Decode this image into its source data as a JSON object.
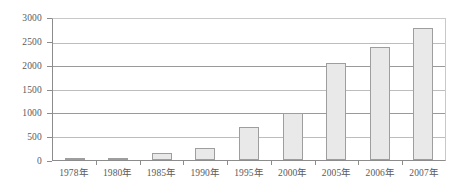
{
  "chart_data": {
    "type": "bar",
    "title": "",
    "subtitle": "",
    "xlabel": "",
    "ylabel": "",
    "categories": [
      "1978年",
      "1980年",
      "1985年",
      "1990年",
      "1995年",
      "2000年",
      "2005年",
      "2006年",
      "2007年"
    ],
    "values": [
      20,
      30,
      150,
      250,
      700,
      1000,
      2070,
      2400,
      2800
    ],
    "ylim": [
      0,
      3000
    ],
    "yticks": [
      0,
      500,
      1000,
      1500,
      2000,
      2500,
      3000
    ],
    "ytick_labels": [
      "0",
      "500",
      "1000",
      "1500",
      "2000",
      "2500",
      "3000"
    ],
    "grid": true,
    "grid_axis": "y",
    "legend": false,
    "legend_position": "none",
    "series": [
      {
        "name": "",
        "values": [
          20,
          30,
          150,
          250,
          700,
          1000,
          2070,
          2400,
          2800
        ]
      }
    ]
  },
  "style": {
    "bar_fill": "#e9e9e9",
    "bar_border": "#9e9e9e",
    "gridline_color": "#9a9a9a",
    "axis_color": "#8c8c8c",
    "text_color": "#5a5a5a",
    "background": "#ffffff"
  }
}
